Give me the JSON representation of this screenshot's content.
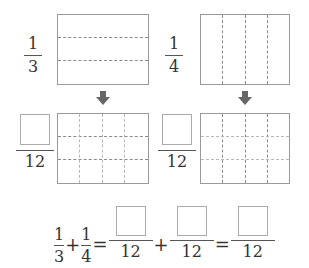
{
  "top_left": {
    "fraction": {
      "numerator": "1",
      "denominator": "3"
    },
    "rows": 3,
    "cols": 1
  },
  "top_right": {
    "fraction": {
      "numerator": "1",
      "denominator": "4"
    },
    "rows": 1,
    "cols": 4
  },
  "arrows": {
    "icon": "down-arrow-icon",
    "color": "#666666"
  },
  "bottom_left": {
    "fraction": {
      "numerator": "",
      "denominator": "12"
    },
    "rows": 3,
    "cols": 4
  },
  "bottom_right": {
    "fraction": {
      "numerator": "",
      "denominator": "12"
    },
    "rows": 3,
    "cols": 4
  },
  "equation": {
    "term1": {
      "numerator": "1",
      "denominator": "3"
    },
    "plus1": "+",
    "term2": {
      "numerator": "1",
      "denominator": "4"
    },
    "equals1": "=",
    "term3": {
      "numerator": "",
      "denominator": "12"
    },
    "plus2": "+",
    "term4": {
      "numerator": "",
      "denominator": "12"
    },
    "equals2": "=",
    "term5": {
      "numerator": "",
      "denominator": "12"
    }
  }
}
